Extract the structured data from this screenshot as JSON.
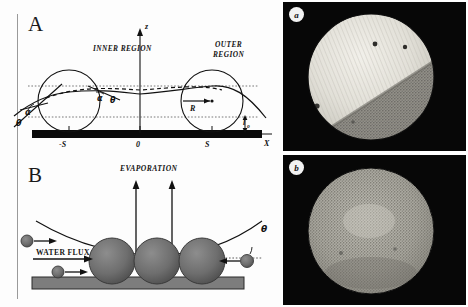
{
  "figure": {
    "panels": [
      {
        "id": "A",
        "letter": "A",
        "labels": {
          "inner_region": "INNER REGION",
          "outer_region_line1": "OUTER",
          "outer_region_line2": "REGION",
          "axis_z": "z",
          "axis_x": "X",
          "origin": "0",
          "tick_left": "-S",
          "tick_right": "S",
          "radius": "R",
          "height": "l",
          "height_sub": "o",
          "angle_alpha_left": "α",
          "angle_alpha_mid": "α",
          "angle_theta_left": "θ",
          "angle_theta_mid": "θ"
        }
      },
      {
        "id": "B",
        "letter": "B",
        "labels": {
          "evaporation": "EVAPORATION",
          "water_flux": "WATER FLUX",
          "contact_angle": "θ"
        }
      },
      {
        "id": "C",
        "letter": "C",
        "images": [
          {
            "tag": "a",
            "caption": ""
          },
          {
            "tag": "b",
            "caption": ""
          }
        ]
      }
    ]
  },
  "colors": {
    "ink": "#111111",
    "substrate": "#0a0a0a",
    "particle": "#6f6f6f",
    "micrograph_background": "#070707",
    "panel_background": "#fdfdfd"
  }
}
